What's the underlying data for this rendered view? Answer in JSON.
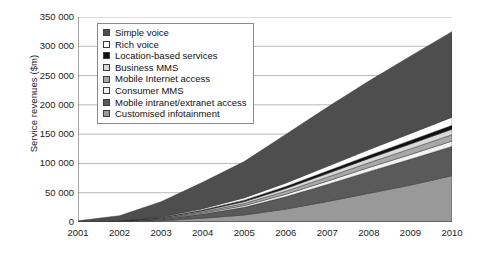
{
  "chart_data": {
    "type": "area",
    "stacked": true,
    "title": "",
    "xlabel": "",
    "ylabel": "Service revenues ($m)",
    "categories": [
      "2001",
      "2002",
      "2003",
      "2004",
      "2005",
      "2006",
      "2007",
      "2008",
      "2009",
      "2010"
    ],
    "x": [
      2001,
      2002,
      2003,
      2004,
      2005,
      2006,
      2007,
      2008,
      2009,
      2010
    ],
    "ylim": [
      0,
      350000
    ],
    "ytick_labels": [
      "0",
      "50 000",
      "100 000",
      "150 000",
      "200 000",
      "250 000",
      "300 000",
      "350 000"
    ],
    "ytick_values": [
      0,
      50000,
      100000,
      150000,
      200000,
      250000,
      300000,
      350000
    ],
    "grid": true,
    "grid_axis": "y",
    "legend_position": "upper-left-inside",
    "series": [
      {
        "name": "Simple voice",
        "color": "#4e4e4e",
        "values": [
          2000,
          9000,
          26000,
          45000,
          62000,
          83000,
          101000,
          117000,
          132000,
          146000
        ]
      },
      {
        "name": "Rich voice",
        "color": "#ffffff",
        "values": [
          0,
          200,
          900,
          2200,
          4000,
          6000,
          8000,
          10000,
          12000,
          14000
        ]
      },
      {
        "name": "Location-based services",
        "color": "#111111",
        "values": [
          0,
          150,
          600,
          1400,
          2400,
          3400,
          4400,
          5200,
          6000,
          6600
        ]
      },
      {
        "name": "Business MMS",
        "color": "#d9d9d9",
        "values": [
          0,
          200,
          800,
          1900,
          3200,
          4600,
          6000,
          7200,
          8400,
          9400
        ]
      },
      {
        "name": "Mobile Internet access",
        "color": "#a8a8a8",
        "values": [
          0,
          200,
          900,
          2100,
          3600,
          5200,
          6800,
          8200,
          9600,
          10800
        ]
      },
      {
        "name": "Consumer MMS",
        "color": "#f2f2f2",
        "values": [
          0,
          150,
          700,
          1700,
          3000,
          4400,
          5800,
          7000,
          8200,
          9200
        ]
      },
      {
        "name": "Mobile intranet/extranet access",
        "color": "#5a5a5a",
        "values": [
          0,
          500,
          2500,
          7000,
          13000,
          21000,
          29000,
          37000,
          44000,
          50000
        ]
      },
      {
        "name": "Customised infotainment",
        "color": "#999999",
        "values": [
          0,
          400,
          2200,
          6500,
          12000,
          22000,
          35000,
          49000,
          63000,
          79000
        ]
      }
    ],
    "totals": [
      2000,
      10800,
      34600,
      67800,
      103200,
      149600,
      206000,
      240600,
      283200,
      325000
    ],
    "legend_items": [
      {
        "label": "Simple voice",
        "swatch": "#4e4e4e"
      },
      {
        "label": "Rich voice",
        "swatch": "#ffffff"
      },
      {
        "label": "Location-based services",
        "swatch": "#111111"
      },
      {
        "label": "Business MMS",
        "swatch": "#d9d9d9"
      },
      {
        "label": "Mobile Internet access",
        "swatch": "#a8a8a8"
      },
      {
        "label": "Consumer MMS",
        "swatch": "#f2f2f2"
      },
      {
        "label": "Mobile intranet/extranet access",
        "swatch": "#5a5a5a"
      },
      {
        "label": "Customised infotainment",
        "swatch": "#999999"
      }
    ]
  }
}
